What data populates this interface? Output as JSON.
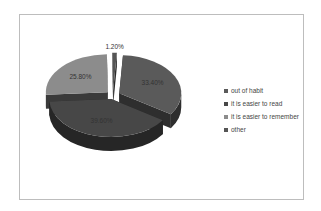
{
  "chart_data": {
    "type": "pie",
    "variant": "3d-exploded",
    "title": "",
    "categories": [
      "out of habit",
      "it is easier to read",
      "it is easier to remember",
      "other"
    ],
    "values": [
      33.4,
      39.6,
      25.8,
      1.2
    ],
    "labels": [
      "33.40%",
      "39.60%",
      "25.80%",
      "1.20%"
    ],
    "colors": [
      "#5a5a5a",
      "#474747",
      "#8c8c8c",
      "#555555"
    ],
    "side_colors": [
      "#2e2e2e",
      "#262626",
      "#3a3a3a",
      "#2a2a2a"
    ],
    "legend_position": "right"
  },
  "legend": {
    "items": [
      {
        "label": "out of habit",
        "color": "#5a5a5a"
      },
      {
        "label": "it is easier to read",
        "color": "#474747"
      },
      {
        "label": "it is easier to remember",
        "color": "#8c8c8c"
      },
      {
        "label": "other",
        "color": "#555555"
      }
    ]
  }
}
